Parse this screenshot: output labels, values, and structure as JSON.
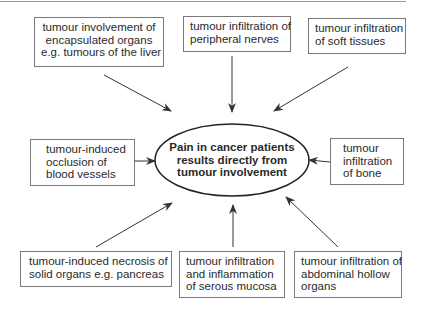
{
  "diagram": {
    "type": "hub-and-spoke",
    "center": {
      "lines": [
        "Pain in cancer patients",
        "results directly from",
        "tumour involvement"
      ]
    },
    "causes": [
      {
        "id": "encapsulated-organs",
        "position": "top-left",
        "lines": [
          "tumour involvement of",
          "encapsulated organs",
          "e.g. tumours of the liver"
        ]
      },
      {
        "id": "peripheral-nerves",
        "position": "top-center",
        "lines": [
          "tumour infiltration of",
          "peripheral nerves"
        ]
      },
      {
        "id": "soft-tissues",
        "position": "top-right",
        "lines": [
          "tumour infiltration",
          "of soft tissues"
        ]
      },
      {
        "id": "blood-vessels",
        "position": "middle-left",
        "lines": [
          "tumour-induced",
          "occlusion of",
          "blood vessels"
        ]
      },
      {
        "id": "bone",
        "position": "middle-right",
        "lines": [
          "tumour",
          "infiltration",
          "of bone"
        ]
      },
      {
        "id": "solid-organs",
        "position": "bottom-left",
        "lines": [
          "tumour-induced necrosis of",
          "solid organs e.g. pancreas"
        ]
      },
      {
        "id": "serous-mucosa",
        "position": "bottom-center",
        "lines": [
          "tumour infiltration",
          "and inflammation",
          "of serous mucosa"
        ]
      },
      {
        "id": "abdominal-hollow-organs",
        "position": "bottom-right",
        "lines": [
          "tumour infiltration of",
          "abdominal hollow",
          "organs"
        ]
      }
    ],
    "colors": {
      "stroke": "#7a7a7a",
      "arrow": "#333333",
      "text": "#2a2a2a"
    }
  }
}
